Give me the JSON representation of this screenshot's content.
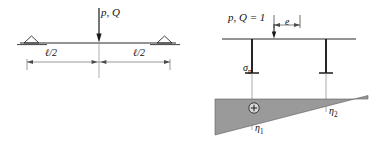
{
  "figure": {
    "background": "#ffffff",
    "line_color": "#2b2b2b",
    "shade_color": "#9a9a9a",
    "shade_edge_color": "#555555"
  },
  "left_diagram": {
    "name": "simply-supported-beam-with-midspan-point-load",
    "load_label": "p, Q",
    "dim_left_label": "ℓ/2",
    "dim_right_label": "ℓ/2",
    "supports": [
      "pinned-triangle-left",
      "pinned-triangle-right"
    ],
    "beam": {
      "x_start": 20,
      "x_end": 176,
      "y": 43
    },
    "load_arrow": {
      "x": 99,
      "y_start": 8,
      "y_end": 43
    },
    "dimension_line": {
      "y": 62,
      "x_start": 27,
      "x_mid": 99,
      "x_end": 170
    }
  },
  "right_diagram": {
    "name": "influence-line-diagram-unit-load",
    "load_label": "p, Q = 1",
    "eccentricity_label": "e",
    "stress_label": "σ",
    "stress_label_sub": "n",
    "ordinate1_label": "η",
    "ordinate1_sub": "1",
    "ordinate2_label": "η",
    "ordinate2_sub": "2",
    "sign_symbol": "⊕",
    "beam": {
      "x_start": 222,
      "x_end": 356,
      "y": 39
    },
    "hanger_left_x": 252,
    "hanger_right_x": 326,
    "tee_y": 73,
    "influence_area": {
      "x_left": 215,
      "x_right": 368,
      "top_y": 99,
      "bottom_left_y": 135,
      "bottom_right_y": 99
    }
  }
}
